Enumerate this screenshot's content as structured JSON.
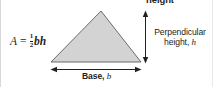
{
  "figure": {
    "formula": {
      "lhs": "A",
      "equals": "=",
      "numerator": "1",
      "denominator": "2",
      "variables": "bh",
      "plain": "A = 1/2 bh"
    },
    "labels": {
      "height_top": "height",
      "perpendicular_line1": "Perpendicular",
      "perpendicular_line2_text": "height,",
      "perpendicular_line2_var": "h",
      "base_text": "Base,",
      "base_var": "b"
    },
    "shape": {
      "name": "triangle",
      "fill": "#d3d3d3",
      "stroke": "#6b6b6b",
      "apex": [
        100,
        11
      ],
      "base_left": [
        50,
        62
      ],
      "base_right": [
        140,
        62
      ]
    },
    "arrows": {
      "height_arrow_name": "vertical-double-arrow",
      "base_arrow_name": "horizontal-double-arrow",
      "color": "#231f20"
    },
    "colors": {
      "background": "#ffffff",
      "text": "#231f20",
      "shape_fill": "#d3d3d3",
      "shape_stroke": "#6b6b6b"
    }
  }
}
